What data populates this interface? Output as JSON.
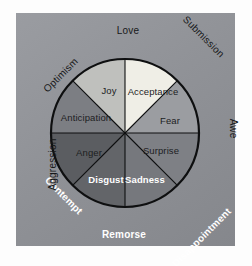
{
  "figure": {
    "panel_color": "#8e9095",
    "background_color": "#ffffff",
    "outline_color": "#0e0f10"
  },
  "wheel": {
    "center_x": 125,
    "center_y": 133,
    "radius": 74,
    "segments": [
      {
        "id": "joy",
        "label": "Joy",
        "start_angle": -90,
        "end_angle": -45,
        "color": "#efeee6",
        "text_color": "#1c1d1f",
        "text_weight": "dark",
        "label_x": 109,
        "label_y": 90
      },
      {
        "id": "acceptance",
        "label": "Acceptance",
        "start_angle": -45,
        "end_angle": 0,
        "color": "#9b9da1",
        "text_color": "#1c1d1f",
        "text_weight": "dark",
        "label_x": 153,
        "label_y": 91
      },
      {
        "id": "fear",
        "label": "Fear",
        "start_angle": 0,
        "end_angle": 45,
        "color": "#7e8085",
        "text_color": "#1c1d1f",
        "text_weight": "dark",
        "label_x": 170,
        "label_y": 120
      },
      {
        "id": "surprise",
        "label": "Surprise",
        "start_angle": 45,
        "end_angle": 90,
        "color": "#76787d",
        "text_color": "#1c1d1f",
        "text_weight": "dark",
        "label_x": 161,
        "label_y": 150
      },
      {
        "id": "sadness",
        "label": "Sadness",
        "start_angle": 90,
        "end_angle": 135,
        "color": "#636569",
        "text_color": "#ffffff",
        "text_weight": "light",
        "label_x": 145,
        "label_y": 179
      },
      {
        "id": "disgust",
        "label": "Disgust",
        "start_angle": 135,
        "end_angle": 180,
        "color": "#5b5d61",
        "text_color": "#ffffff",
        "text_weight": "light",
        "label_x": 106,
        "label_y": 179
      },
      {
        "id": "anger",
        "label": "Anger",
        "start_angle": 180,
        "end_angle": 225,
        "color": "#7c7e83",
        "text_color": "#1c1d1f",
        "text_weight": "dark",
        "label_x": 89,
        "label_y": 152
      },
      {
        "id": "anticipation",
        "label": "Anticipation",
        "start_angle": 225,
        "end_angle": 270,
        "color": "#bfc0bd",
        "text_color": "#1c1d1f",
        "text_weight": "dark",
        "label_x": 86,
        "label_y": 117
      }
    ]
  },
  "dyads": [
    {
      "id": "love",
      "label": "Love",
      "x": 128,
      "y": 30,
      "rotation": 0,
      "tone": "dark"
    },
    {
      "id": "submission",
      "label": "Submission",
      "x": 192,
      "y": 54,
      "rotation": 45,
      "tone": "dark"
    },
    {
      "id": "awe",
      "label": "Awe",
      "x": 218,
      "y": 133,
      "rotation": 90,
      "tone": "dark"
    },
    {
      "id": "disappointment",
      "label": "Disappointment",
      "x": 194,
      "y": 208,
      "rotation": -45,
      "tone": "light"
    },
    {
      "id": "remorse",
      "label": "Remorse",
      "x": 124,
      "y": 234,
      "rotation": 0,
      "tone": "light"
    },
    {
      "id": "contempt",
      "label": "Contempt",
      "x": 53,
      "y": 211,
      "rotation": 45,
      "tone": "light"
    },
    {
      "id": "aggression",
      "label": "Aggression",
      "x": 32,
      "y": 133,
      "rotation": -90,
      "tone": "dark"
    },
    {
      "id": "optimism",
      "label": "Optimism",
      "x": 58,
      "y": 58,
      "rotation": -45,
      "tone": "dark"
    }
  ]
}
